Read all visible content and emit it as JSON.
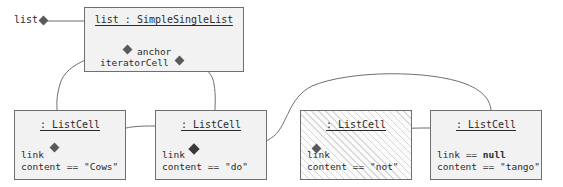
{
  "diagram": {
    "type": "uml-object-diagram",
    "background": "#ffffff",
    "box_fill": "#f2f2f2",
    "border_color": "#6f6f6f",
    "text_color": "#2b2b2b",
    "external_label": "list",
    "list_object": {
      "title": "list : SimpleSingleList",
      "slots": [
        {
          "name": "anchor",
          "diamond": "left"
        },
        {
          "name": "iteratorCell",
          "diamond": "right"
        }
      ]
    },
    "cells": [
      {
        "title": ": ListCell",
        "link_label": "link",
        "link_value": "",
        "link_has_diamond": true,
        "content_label": "content",
        "content_op": "==",
        "content_value": "\"Cows\"",
        "hatched": false
      },
      {
        "title": ": ListCell",
        "link_label": "link",
        "link_value": "",
        "link_has_diamond": true,
        "content_label": "content",
        "content_op": "==",
        "content_value": "\"do\"",
        "hatched": false
      },
      {
        "title": ": ListCell",
        "link_label": "link",
        "link_value": "",
        "link_has_diamond": true,
        "content_label": "content",
        "content_op": "==",
        "content_value": "\"not\"",
        "hatched": true
      },
      {
        "title": ": ListCell",
        "link_label": "link",
        "link_op": "==",
        "link_value": "null",
        "link_has_diamond": false,
        "content_label": "content",
        "content_op": "==",
        "content_value": "\"tango\"",
        "hatched": false
      }
    ],
    "connections": [
      {
        "from": "list-external",
        "to": "list-object",
        "style": "straight"
      },
      {
        "from": "anchor",
        "to": "cell-1",
        "style": "curve"
      },
      {
        "from": "iteratorCell",
        "to": "cell-2",
        "style": "curve"
      },
      {
        "from": "cell-1.link",
        "to": "cell-2",
        "style": "curve"
      },
      {
        "from": "cell-2.link",
        "to": "cell-4",
        "style": "arc"
      },
      {
        "from": "cell-3.link",
        "to": "cell-4",
        "style": "curve"
      }
    ]
  }
}
